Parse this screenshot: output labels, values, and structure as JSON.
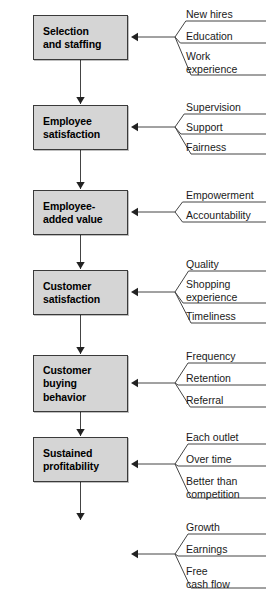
{
  "diagram": {
    "colors": {
      "box_fill": "#d5d5d5",
      "box_border": "#3a3a3a",
      "line": "#444444",
      "text": "#000000",
      "rule": "#111111"
    },
    "nodes": [
      {
        "id": "selection-and-staffing",
        "label": "Selection\nand staffing",
        "drivers": [
          "New hires",
          "Education",
          "Work\nexperience"
        ]
      },
      {
        "id": "employee-satisfaction",
        "label": "Employee\nsatisfaction",
        "drivers": [
          "Supervision",
          "Support",
          "Fairness"
        ]
      },
      {
        "id": "employee-added-value",
        "label": "Employee-\nadded value",
        "drivers": [
          "Empowerment",
          "Accountability"
        ]
      },
      {
        "id": "customer-satisfaction",
        "label": "Customer\nsatisfaction",
        "drivers": [
          "Quality",
          "Shopping\nexperience",
          "Timeliness"
        ]
      },
      {
        "id": "customer-buying-behavior",
        "label": "Customer\nbuying\nbehavior",
        "drivers": [
          "Frequency",
          "Retention",
          "Referral"
        ]
      },
      {
        "id": "sustained-profitability",
        "label": "Sustained\nprofitability",
        "drivers": [
          "Each outlet",
          "Over time",
          "Better than\ncompetition"
        ]
      },
      {
        "id": "shareholder-value",
        "symbol": "$",
        "label": "Shareholder\nvalue",
        "drivers": [
          "Growth",
          "Earnings",
          "Free\ncash flow"
        ]
      }
    ]
  }
}
